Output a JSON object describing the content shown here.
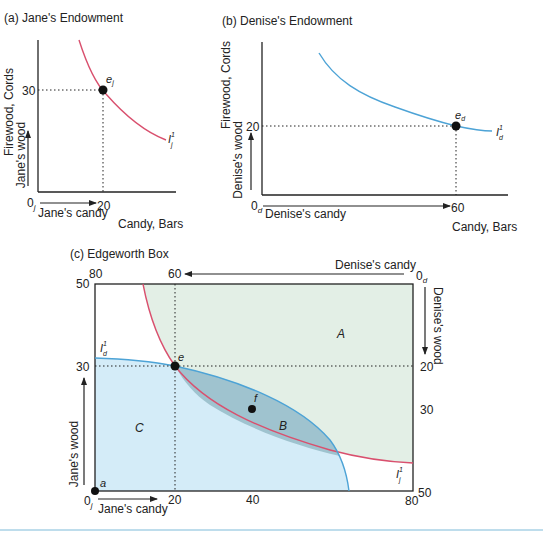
{
  "panels": {
    "a": {
      "title": "(a) Jane's Endowment",
      "ylabel": "Firewood, Cords",
      "xlabel": "Candy, Bars",
      "y_arrow_label": "Jane's wood",
      "x_arrow_label": "Jane's candy",
      "origin": "0",
      "origin_sub": "j",
      "y_tick": "30",
      "x_tick": "20",
      "point_label": "e",
      "point_sub": "j",
      "curve_label": "I",
      "curve_sup": "1",
      "curve_sub": "j",
      "curve_color": "#d9506e"
    },
    "b": {
      "title": "(b) Denise's Endowment",
      "ylabel": "Firewood, Cords",
      "xlabel": "Candy, Bars",
      "y_arrow_label": "Denise's wood",
      "x_arrow_label": "Denise's candy",
      "origin": "0",
      "origin_sub": "d",
      "y_tick": "20",
      "x_tick": "60",
      "point_label": "e",
      "point_sub": "d",
      "curve_label": "I",
      "curve_sup": "1",
      "curve_sub": "d",
      "curve_color": "#4da3d6"
    },
    "c": {
      "title": "(c) Edgeworth Box",
      "top_left_tick": "80",
      "top_tick": "60",
      "top_arrow_label": "Denise's candy",
      "top_right_origin": "0",
      "top_right_origin_sub": "d",
      "right_arrow_label": "Denise's wood",
      "right_ticks": [
        "20",
        "30",
        "50"
      ],
      "left_ticks": [
        "50",
        "30"
      ],
      "left_arrow_label": "Jane's wood",
      "bottom_origin": "0",
      "bottom_origin_sub": "j",
      "bottom_arrow_label": "Jane's candy",
      "bottom_ticks": [
        "20",
        "40",
        "80"
      ],
      "point_e": "e",
      "point_f": "f",
      "point_a": "a",
      "region_A": "A",
      "region_B": "B",
      "region_C": "C",
      "curve_d_label": "I",
      "curve_d_sup": "1",
      "curve_d_sub": "d",
      "curve_j_label": "I",
      "curve_j_sup": "1",
      "curve_j_sub": "j",
      "colors": {
        "jane_curve": "#d9506e",
        "denise_curve": "#4da3d6",
        "region_A_fill": "#e3efe6",
        "region_B_fill": "#9fc3cf",
        "region_C_fill": "#d4ecf8",
        "footer_rule": "#a9d2e6"
      }
    }
  }
}
